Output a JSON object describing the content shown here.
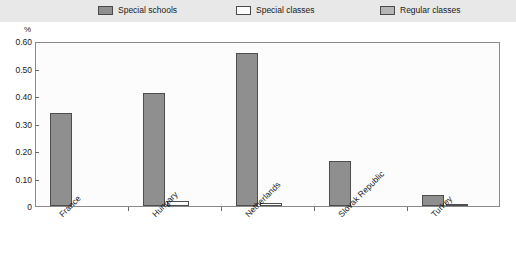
{
  "legend": {
    "items": [
      {
        "label": "Special schools",
        "color": "#8f8f8f",
        "key": "special-schools"
      },
      {
        "label": "Special classes",
        "color": "#fdfdfd",
        "key": "special-classes"
      },
      {
        "label": "Regular classes",
        "color": "#b5b5b5",
        "key": "regular-classes"
      }
    ]
  },
  "axis": {
    "unit": "%",
    "yticks": [
      "0.60",
      "0.50",
      "0.40",
      "0.30",
      "0.20",
      "0.10",
      "0"
    ]
  },
  "chart_data": {
    "type": "bar",
    "title": "",
    "subtitle": "",
    "xlabel": "",
    "ylabel": "%",
    "ylim": [
      0,
      0.6
    ],
    "yticks": [
      0,
      0.1,
      0.2,
      0.3,
      0.4,
      0.5,
      0.6
    ],
    "grid": false,
    "legend_position": "top",
    "categories": [
      "France",
      "Hungary",
      "Netherlands",
      "Slovak Republic",
      "Turkey"
    ],
    "series": [
      {
        "name": "Special schools",
        "color": "#8f8f8f",
        "values": [
          0.34,
          0.41,
          0.555,
          0.165,
          0.04
        ]
      },
      {
        "name": "Special classes",
        "color": "#fdfdfd",
        "values": [
          0,
          0.02,
          0.012,
          0,
          0.006
        ]
      },
      {
        "name": "Regular classes",
        "color": "#b5b5b5",
        "values": [
          0,
          0,
          0,
          0,
          0
        ]
      }
    ]
  }
}
